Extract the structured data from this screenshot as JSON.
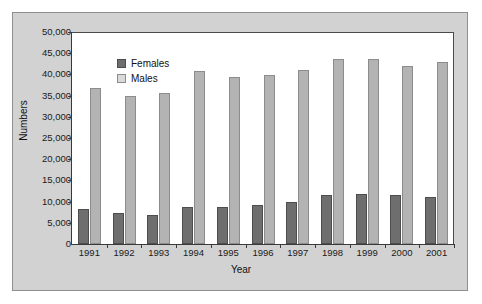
{
  "chart_data": {
    "type": "bar",
    "title": "",
    "subtitle": "",
    "xlabel": "Year",
    "ylabel": "Numbers",
    "categories": [
      "1991",
      "1992",
      "1993",
      "1994",
      "1995",
      "1996",
      "1997",
      "1998",
      "1999",
      "2000",
      "2001"
    ],
    "series": [
      {
        "name": "Females",
        "color": "#6e6e6e",
        "values": [
          8200,
          7200,
          6900,
          8700,
          8700,
          9200,
          9900,
          11500,
          11900,
          11500,
          11200
        ]
      },
      {
        "name": "Males",
        "color": "#b3b3b3",
        "values": [
          36700,
          35000,
          35600,
          40700,
          39400,
          39800,
          41100,
          43700,
          43700,
          42000,
          42900
        ]
      }
    ],
    "ylim": [
      0,
      50000
    ],
    "y_ticks": [
      0,
      5000,
      10000,
      15000,
      20000,
      25000,
      30000,
      35000,
      40000,
      45000,
      50000
    ],
    "y_tick_labels": [
      "0",
      "5,000",
      "10,000",
      "15,000",
      "20,000",
      "25,000",
      "30,000",
      "35,000",
      "40,000",
      "45,000",
      "50,000"
    ],
    "grid": false,
    "legend_position": "top-left",
    "legend_entries": [
      "Females",
      "Males"
    ],
    "plot_background": "#ffffff",
    "figure_background": "#d2d2d2",
    "axis_color": "#3a3a3a"
  }
}
